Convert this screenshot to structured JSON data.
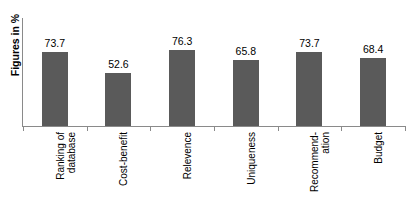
{
  "chart_data": {
    "type": "bar",
    "title": "",
    "xlabel": "",
    "ylabel": "Figures in %",
    "categories": [
      "Ranking of\ndatabase",
      "Cost-benefit",
      "Relevence",
      "Uniqueness",
      "Recommend-\nation",
      "Budget"
    ],
    "values": [
      73.7,
      52.6,
      76.3,
      65.8,
      73.7,
      68.4
    ],
    "value_labels": [
      "73.7",
      "52.6",
      "76.3",
      "65.8",
      "73.7",
      "68.4"
    ],
    "ylim": [
      0,
      100
    ],
    "grid": false,
    "legend": null,
    "bar_color": "#5a5a5a",
    "axis_color": "#8a8a8a",
    "text_color": "#000000",
    "background": "#ffffff"
  }
}
